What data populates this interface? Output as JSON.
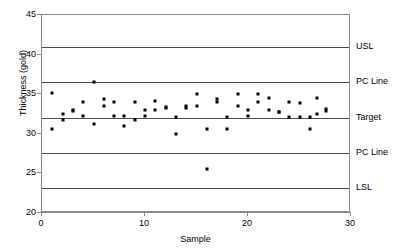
{
  "chart_data": {
    "type": "scatter",
    "title": "",
    "xlabel": "Sample",
    "ylabel": "Thickness (gold)",
    "xlim": [
      0,
      30
    ],
    "ylim": [
      20,
      45
    ],
    "xticks": [
      0,
      10,
      20,
      30
    ],
    "yticks": [
      20,
      25,
      30,
      35,
      40,
      45
    ],
    "grid": false,
    "legend": "none",
    "reference_lines": [
      {
        "label": "USL",
        "value": 40.9
      },
      {
        "label": "PC Line",
        "value": 36.6
      },
      {
        "label": "Target",
        "value": 32.0
      },
      {
        "label": "PC Line",
        "value": 27.6
      },
      {
        "label": "LSL",
        "value": 23.1
      }
    ],
    "series": [
      {
        "name": "Thickness",
        "marker": "square",
        "color": "#000000",
        "points": [
          {
            "x": 1,
            "y": 35.1
          },
          {
            "x": 1,
            "y": 30.6
          },
          {
            "x": 2,
            "y": 32.5
          },
          {
            "x": 2,
            "y": 31.7
          },
          {
            "x": 3,
            "y": 33.0
          },
          {
            "x": 3,
            "y": 32.9
          },
          {
            "x": 4,
            "y": 34.0
          },
          {
            "x": 4,
            "y": 32.2
          },
          {
            "x": 5,
            "y": 36.6
          },
          {
            "x": 5,
            "y": 31.2
          },
          {
            "x": 6,
            "y": 34.4
          },
          {
            "x": 6,
            "y": 33.5
          },
          {
            "x": 7,
            "y": 34.0
          },
          {
            "x": 7,
            "y": 32.2
          },
          {
            "x": 8,
            "y": 32.2
          },
          {
            "x": 8,
            "y": 31.0
          },
          {
            "x": 9,
            "y": 34.0
          },
          {
            "x": 9,
            "y": 31.8
          },
          {
            "x": 10,
            "y": 33.0
          },
          {
            "x": 10,
            "y": 32.2
          },
          {
            "x": 11,
            "y": 34.1
          },
          {
            "x": 11,
            "y": 33.0
          },
          {
            "x": 12,
            "y": 33.4
          },
          {
            "x": 12,
            "y": 33.2
          },
          {
            "x": 13,
            "y": 32.1
          },
          {
            "x": 13,
            "y": 30.0
          },
          {
            "x": 14,
            "y": 33.5
          },
          {
            "x": 14,
            "y": 33.3
          },
          {
            "x": 15,
            "y": 35.0
          },
          {
            "x": 15,
            "y": 33.5
          },
          {
            "x": 16,
            "y": 30.6
          },
          {
            "x": 16,
            "y": 25.6
          },
          {
            "x": 17,
            "y": 34.4
          },
          {
            "x": 17,
            "y": 34.0
          },
          {
            "x": 18,
            "y": 32.1
          },
          {
            "x": 18,
            "y": 30.6
          },
          {
            "x": 19,
            "y": 35.0
          },
          {
            "x": 19,
            "y": 33.5
          },
          {
            "x": 20,
            "y": 33.0
          },
          {
            "x": 20,
            "y": 32.2
          },
          {
            "x": 21,
            "y": 35.0
          },
          {
            "x": 21,
            "y": 34.0
          },
          {
            "x": 22,
            "y": 34.5
          },
          {
            "x": 22,
            "y": 33.0
          },
          {
            "x": 23,
            "y": 32.8
          },
          {
            "x": 23,
            "y": 32.7
          },
          {
            "x": 24,
            "y": 34.0
          },
          {
            "x": 24,
            "y": 32.1
          },
          {
            "x": 25,
            "y": 33.9
          },
          {
            "x": 25,
            "y": 32.1
          },
          {
            "x": 26,
            "y": 32.1
          },
          {
            "x": 26,
            "y": 30.6
          },
          {
            "x": 26.7,
            "y": 34.5
          },
          {
            "x": 26.7,
            "y": 32.5
          },
          {
            "x": 27.6,
            "y": 33.1
          },
          {
            "x": 27.6,
            "y": 32.9
          }
        ]
      }
    ]
  }
}
